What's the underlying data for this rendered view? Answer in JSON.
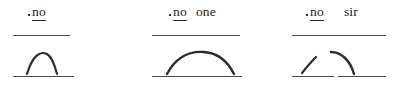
{
  "figure": {
    "type": "intonation-contour-diagram",
    "ink_color": "#2b2b2b",
    "line_color": "#4a4a4a",
    "background_color": "#ffffff"
  },
  "groups": [
    {
      "id": "group-1",
      "utterance": "no",
      "words": [
        {
          "text": "no",
          "stressed": true,
          "underlined": true
        }
      ],
      "contour": {
        "name": "rise-fall",
        "shape": "narrow-arch",
        "segments": 1
      },
      "baseline_segments": 1
    },
    {
      "id": "group-2",
      "utterance": "no one",
      "words": [
        {
          "text": "no",
          "stressed": true,
          "underlined": true
        },
        {
          "text": "one",
          "stressed": false,
          "underlined": false
        }
      ],
      "contour": {
        "name": "rise-fall",
        "shape": "wide-arch",
        "segments": 1
      },
      "baseline_segments": 1
    },
    {
      "id": "group-3",
      "utterance": "no sir",
      "words": [
        {
          "text": "no",
          "stressed": true,
          "underlined": true
        },
        {
          "text": "sir",
          "stressed": false,
          "underlined": false
        }
      ],
      "contour": {
        "name": "rise plus fall",
        "shape": "split-rise-then-fall",
        "segments": 2
      },
      "baseline_segments": 2
    }
  ]
}
